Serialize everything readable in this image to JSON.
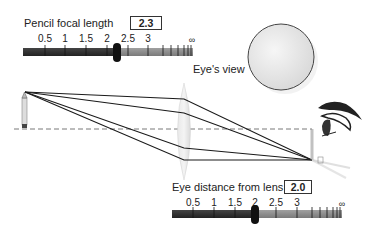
{
  "top_slider": {
    "label": "Pencil focal length",
    "value": "2.3",
    "tick_labels": [
      "0.5",
      "1",
      "1.5",
      "2",
      "2.5",
      "3",
      "∞"
    ]
  },
  "bottom_slider": {
    "label": "Eye distance from lens",
    "value": "2.0",
    "tick_labels": [
      "0.5",
      "1",
      "1.5",
      "2",
      "2.5",
      "3",
      "∞"
    ]
  },
  "eye_view": {
    "label": "Eye's view"
  },
  "colors": {
    "slider_dark": "#333333",
    "slider_light": "#8a8a8a",
    "lens": "#e2e2e2",
    "ray": "#1a1a1a"
  }
}
